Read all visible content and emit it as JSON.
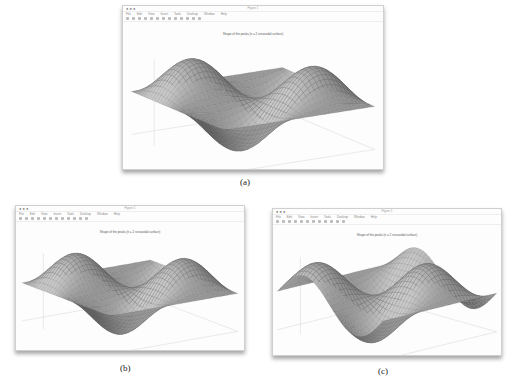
{
  "figure": {
    "panels": [
      {
        "id": "a",
        "label": "(a)",
        "window_title": "Figure 1",
        "plot_title": "Shape of the peaks (n = 2 sinusoidal surface)",
        "menu": [
          "File",
          "Edit",
          "View",
          "Insert",
          "Tools",
          "Desktop",
          "Window",
          "Help"
        ],
        "surface_color": "#8c8c8c"
      },
      {
        "id": "b",
        "label": "(b)",
        "window_title": "Figure 1",
        "plot_title": "Shape of the peaks (n = 2 sinusoidal surface)",
        "menu": [
          "File",
          "Edit",
          "View",
          "Insert",
          "Tools",
          "Desktop",
          "Window",
          "Help"
        ],
        "surface_color": "#8c8c8c"
      },
      {
        "id": "c",
        "label": "(c)",
        "window_title": "Figure 1",
        "plot_title": "Shape of the peaks (n = 2 sinusoidal surface)",
        "menu": [
          "File",
          "Edit",
          "View",
          "Insert",
          "Tools",
          "Desktop",
          "Window",
          "Help"
        ],
        "surface_color": "#8c8c8c"
      }
    ]
  },
  "chart_data": [
    {
      "type": "surface",
      "title": "Shape of the peaks (n = 2 sinusoidal surface)",
      "description": "3D mesh surface z = sin(x)·sin(y) style, 2 peaks and 2 valleys in view",
      "panel": "a"
    },
    {
      "type": "surface",
      "title": "Shape of the peaks (n = 2 sinusoidal surface)",
      "description": "3D mesh surface, rotated view",
      "panel": "b"
    },
    {
      "type": "surface",
      "title": "Shape of the peaks (n = 2 sinusoidal surface)",
      "description": "3D mesh surface, alternate rotated view",
      "panel": "c"
    }
  ]
}
